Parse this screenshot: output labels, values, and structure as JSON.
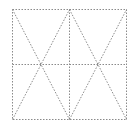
{
  "diagram": {
    "title": "",
    "line_color": "#8a8a8a",
    "line_style": "dotted",
    "frame": {
      "x1": 12,
      "y1": 9,
      "x2": 126,
      "y2": 119
    },
    "center": {
      "x": 69,
      "y": 64
    },
    "lines": [
      {
        "name": "vertical-center-line",
        "x1": 69,
        "y1": 9,
        "x2": 69,
        "y2": 119
      },
      {
        "name": "horizontal-center-line",
        "x1": 12,
        "y1": 64,
        "x2": 126,
        "y2": 64
      },
      {
        "name": "diagonal-top-left-to-bottom-center",
        "x1": 12,
        "y1": 9,
        "x2": 69,
        "y2": 119
      },
      {
        "name": "diagonal-bottom-left-to-top-center",
        "x1": 12,
        "y1": 119,
        "x2": 69,
        "y2": 9
      },
      {
        "name": "diagonal-top-center-to-bottom-right",
        "x1": 69,
        "y1": 9,
        "x2": 126,
        "y2": 119
      },
      {
        "name": "diagonal-bottom-center-to-top-right",
        "x1": 69,
        "y1": 119,
        "x2": 126,
        "y2": 9
      }
    ]
  }
}
